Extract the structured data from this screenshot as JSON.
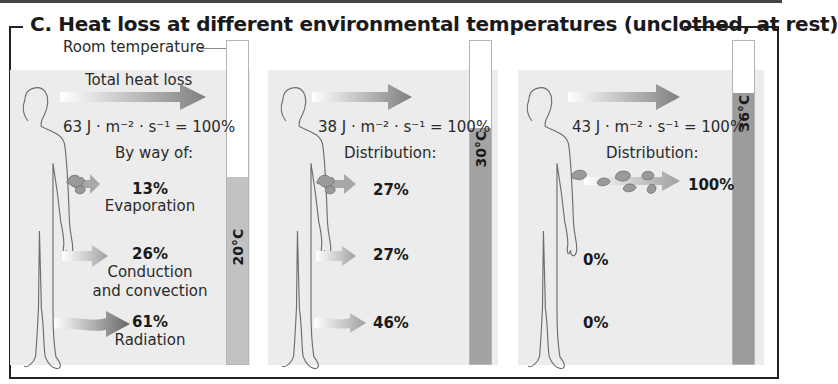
{
  "figure": {
    "title": "C.  Heat loss at different environmental temperatures (unclothed, at rest)",
    "room_temperature_label": "Room temperature"
  },
  "colors": {
    "panel_bg": "#ececec",
    "thermo_fill_20": "#c2c2c2",
    "thermo_fill_30": "#a3a3a3",
    "thermo_fill_36": "#9c9c9c",
    "arrow_dark": "#8a8a8a",
    "outline": "#6e6e6e"
  },
  "panels": [
    {
      "temperature": "20°C",
      "fill_percent": 58,
      "total_label": "Total heat loss",
      "total_value": "63 J · m⁻² · s⁻¹ = 100%",
      "section_label": "By way of:",
      "items": [
        {
          "percent": "13%",
          "label": "Evaporation"
        },
        {
          "percent": "26%",
          "label": "Conduction\nand convection",
          "label_line1": "Conduction",
          "label_line2": "and convection"
        },
        {
          "percent": "61%",
          "label": "Radiation"
        }
      ]
    },
    {
      "temperature": "30°C",
      "fill_percent": 73,
      "total_value": "38 J · m⁻² · s⁻¹ = 100%",
      "section_label": "Distribution:",
      "items": [
        {
          "percent": "27%"
        },
        {
          "percent": "27%"
        },
        {
          "percent": "46%"
        }
      ]
    },
    {
      "temperature": "36°C",
      "fill_percent": 84,
      "total_value": "43 J · m⁻² · s⁻¹ = 100%",
      "section_label": "Distribution:",
      "items": [
        {
          "percent": "100%"
        },
        {
          "percent": "0%"
        },
        {
          "percent": "0%"
        }
      ]
    }
  ]
}
